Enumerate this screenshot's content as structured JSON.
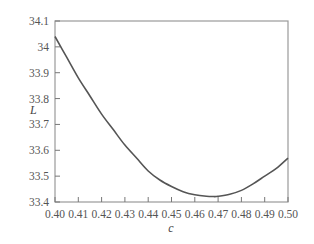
{
  "chart_data": {
    "type": "line",
    "title": "",
    "xlabel": "c",
    "ylabel": "L",
    "xlim": [
      0.4,
      0.5
    ],
    "ylim": [
      33.4,
      34.1
    ],
    "grid": false,
    "legend": null,
    "x_ticks": [
      "0.40",
      "0.41",
      "0.42",
      "0.43",
      "0.44",
      "0.45",
      "0.46",
      "0.47",
      "0.48",
      "0.49",
      "0.50"
    ],
    "y_ticks": [
      "33.4",
      "33.5",
      "33.6",
      "33.7",
      "33.8",
      "33.9",
      "34",
      "34.1"
    ],
    "series": [
      {
        "name": "L(c)",
        "color": "#555555",
        "x": [
          0.4,
          0.405,
          0.41,
          0.415,
          0.42,
          0.425,
          0.43,
          0.435,
          0.44,
          0.445,
          0.45,
          0.455,
          0.46,
          0.465,
          0.468,
          0.47,
          0.475,
          0.48,
          0.485,
          0.49,
          0.495,
          0.5
        ],
        "y": [
          34.04,
          33.96,
          33.88,
          33.81,
          33.74,
          33.68,
          33.62,
          33.57,
          33.52,
          33.485,
          33.46,
          33.44,
          33.428,
          33.422,
          33.421,
          33.422,
          33.43,
          33.445,
          33.47,
          33.5,
          33.53,
          33.57
        ]
      }
    ]
  }
}
